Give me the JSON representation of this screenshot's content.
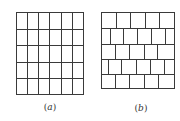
{
  "colors": {
    "line": "#3a3a3a",
    "background": "#ffffff",
    "label": "#333333"
  },
  "panels": [
    {
      "id": "a",
      "label_open": "(",
      "label_letter": "a",
      "label_close": ")",
      "label_pos": {
        "x": 50,
        "y": 102
      },
      "type": "square-grid",
      "bounds": {
        "left": 16,
        "top": 12,
        "right": 83,
        "bottom": 94
      },
      "columns": 6,
      "rows": 5,
      "v_lines": [
        16,
        27,
        38,
        49,
        61,
        72,
        83
      ],
      "h_lines": [
        12,
        29,
        45,
        62,
        78,
        94
      ]
    },
    {
      "id": "b",
      "label_open": "(",
      "label_letter": "b",
      "label_close": ")",
      "label_pos": {
        "x": 141,
        "y": 103
      },
      "type": "brick-bond",
      "bounds": {
        "left": 101,
        "top": 12,
        "right": 174,
        "bottom": 88
      },
      "h_lines": [
        12,
        28,
        44,
        59,
        74,
        88
      ],
      "rows": [
        {
          "y0": 12,
          "y1": 28,
          "joints": [
            116,
            130,
            145,
            159
          ]
        },
        {
          "y0": 28,
          "y1": 44,
          "joints": [
            110,
            123,
            137,
            151,
            165
          ]
        },
        {
          "y0": 44,
          "y1": 59,
          "joints": [
            115,
            129,
            144,
            157
          ]
        },
        {
          "y0": 59,
          "y1": 74,
          "joints": [
            108,
            121,
            136,
            150,
            164
          ]
        },
        {
          "y0": 74,
          "y1": 88,
          "joints": [
            115,
            129,
            144,
            158
          ]
        }
      ]
    }
  ]
}
